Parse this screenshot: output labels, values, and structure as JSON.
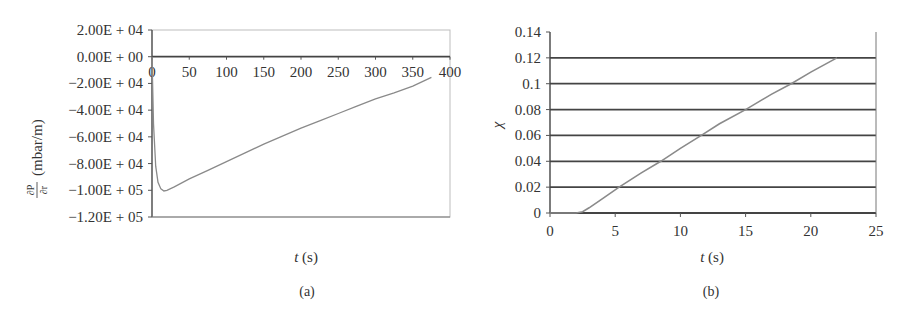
{
  "chart_data": [
    {
      "type": "line",
      "panel": "(a)",
      "title": "",
      "xlabel": "t (s)",
      "ylabel": "∂P/∂r (mbar/m)",
      "xlim": [
        0,
        400
      ],
      "ylim": [
        -120000,
        20000
      ],
      "x_ticks": [
        "0",
        "50",
        "100",
        "150",
        "200",
        "250",
        "300",
        "350",
        "400"
      ],
      "y_ticks": [
        "2.00E + 04",
        "0.00E + 00",
        "−2.00E + 04",
        "−4.00E + 04",
        "−6.00E + 04",
        "−8.00E + 04",
        "−1.00E + 05",
        "−1.20E + 05"
      ],
      "grid": false,
      "x_axis_at_zero": true,
      "series": [
        {
          "name": "dP/dr",
          "x": [
            0,
            2,
            5,
            8,
            12,
            16,
            20,
            30,
            50,
            75,
            100,
            125,
            150,
            175,
            200,
            225,
            250,
            275,
            300,
            325,
            350,
            375
          ],
          "values": [
            0,
            -50000,
            -82000,
            -94000,
            -99000,
            -100500,
            -100000,
            -97500,
            -91500,
            -85000,
            -78500,
            -72000,
            -65500,
            -59500,
            -53500,
            -48000,
            -42500,
            -37000,
            -31500,
            -27000,
            -22000,
            -15500
          ]
        }
      ]
    },
    {
      "type": "line",
      "panel": "(b)",
      "title": "",
      "xlabel": "t (s)",
      "ylabel": "χ",
      "xlim": [
        0,
        25
      ],
      "ylim": [
        0,
        0.14
      ],
      "x_ticks": [
        "0",
        "5",
        "10",
        "15",
        "20",
        "25"
      ],
      "y_ticks": [
        "0.14",
        "0.12",
        "0.1",
        "0.08",
        "0.06",
        "0.04",
        "0.02",
        "0"
      ],
      "grid": true,
      "series": [
        {
          "name": "chi",
          "x": [
            0,
            2,
            2.5,
            3,
            4,
            5.3,
            7,
            8.5,
            10,
            11.6,
            13,
            15,
            17,
            18.5,
            20,
            22
          ],
          "values": [
            0,
            0,
            0.001,
            0.004,
            0.011,
            0.02,
            0.031,
            0.04,
            0.05,
            0.06,
            0.069,
            0.08,
            0.092,
            0.1,
            0.109,
            0.12
          ]
        }
      ]
    }
  ],
  "panels": {
    "a": {
      "caption": "(a)",
      "xlabel_italic": "t",
      "xlabel_unit": " (s)",
      "ylabel_frac_num": "∂P",
      "ylabel_frac_den": "∂r",
      "ylabel_unit": "(mbar/m)"
    },
    "b": {
      "caption": "(b)",
      "xlabel_italic": "t",
      "xlabel_unit": " (s)",
      "ylabel": "χ"
    }
  }
}
